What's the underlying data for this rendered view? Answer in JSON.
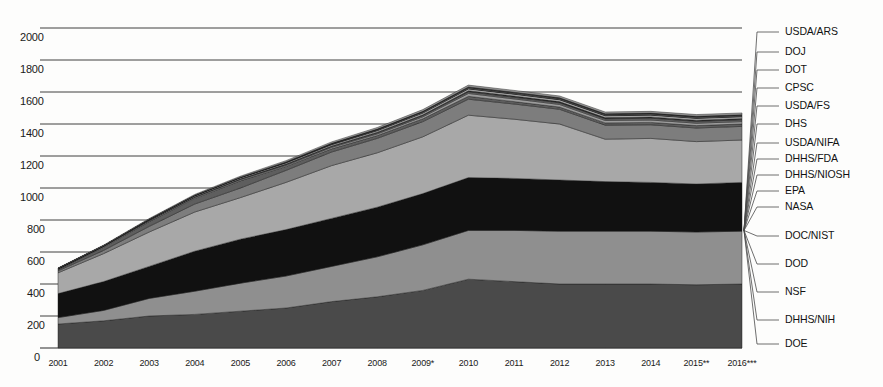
{
  "chart_data": {
    "type": "area",
    "title": "",
    "xlabel": "",
    "ylabel": "",
    "stacked": true,
    "grid": true,
    "legend_position": "right-leader-lines",
    "ylim": [
      0,
      2000
    ],
    "yticks": [
      0,
      200,
      400,
      600,
      800,
      1000,
      1200,
      1400,
      1600,
      1800,
      2000
    ],
    "ytick_labels": [
      "0",
      "200",
      "400",
      "600",
      "800",
      "1000",
      "1200",
      "1400",
      "1600",
      "1800",
      "2000"
    ],
    "categories": [
      "2001",
      "2002",
      "2003",
      "2004",
      "2005",
      "2006",
      "2007",
      "2008",
      "2009*",
      "2010",
      "2011",
      "2012",
      "2013",
      "2014",
      "2015**",
      "2016***"
    ],
    "x_values": [
      2001,
      2002,
      2003,
      2004,
      2005,
      2006,
      2007,
      2008,
      2009,
      2010,
      2011,
      2012,
      2013,
      2014,
      2015,
      2016
    ],
    "footnotes": [
      "* 2009 includes ARRA funds",
      "** 2015 estimate",
      "*** 2016 proposed"
    ],
    "series": [
      {
        "name": "DOE",
        "color": "#4a4a4a",
        "values": [
          150,
          170,
          200,
          210,
          230,
          250,
          290,
          320,
          360,
          430,
          415,
          400,
          400,
          400,
          395,
          400
        ]
      },
      {
        "name": "DHHS/NIH",
        "color": "#8f8f8f",
        "values": [
          40,
          65,
          110,
          145,
          175,
          200,
          220,
          250,
          285,
          305,
          320,
          330,
          330,
          330,
          330,
          330
        ]
      },
      {
        "name": "NSF",
        "color": "#111111",
        "values": [
          150,
          180,
          200,
          250,
          275,
          290,
          300,
          310,
          320,
          330,
          325,
          320,
          310,
          305,
          300,
          305
        ]
      },
      {
        "name": "DOD",
        "color": "#a8a8a8",
        "values": [
          130,
          175,
          215,
          245,
          260,
          295,
          330,
          340,
          355,
          390,
          370,
          350,
          265,
          275,
          265,
          265
        ]
      },
      {
        "name": "DOC/NIST",
        "color": "#7d7d7d",
        "values": [
          12,
          20,
          35,
          50,
          60,
          75,
          85,
          90,
          95,
          100,
          95,
          92,
          88,
          85,
          85,
          85
        ]
      },
      {
        "name": "NASA",
        "color": "#5e5e5e",
        "values": [
          8,
          20,
          30,
          35,
          45,
          25,
          20,
          18,
          18,
          18,
          15,
          14,
          14,
          15,
          15,
          15
        ]
      },
      {
        "name": "EPA",
        "color": "#9c9c9c",
        "values": [
          5,
          6,
          6,
          6,
          7,
          7,
          9,
          10,
          12,
          18,
          17,
          16,
          15,
          15,
          15,
          15
        ]
      },
      {
        "name": "DHHS/NIOSH",
        "color": "#6a6a6a",
        "values": [
          0,
          0,
          2,
          3,
          4,
          5,
          6,
          7,
          8,
          10,
          10,
          10,
          10,
          11,
          11,
          11
        ]
      },
      {
        "name": "DHHS/FDA",
        "color": "#303030",
        "values": [
          0,
          0,
          0,
          2,
          2,
          3,
          3,
          4,
          5,
          7,
          8,
          8,
          8,
          8,
          8,
          8
        ]
      },
      {
        "name": "USDA/NIFA",
        "color": "#b5b5b5",
        "values": [
          2,
          3,
          4,
          5,
          6,
          7,
          8,
          9,
          10,
          11,
          11,
          11,
          11,
          11,
          11,
          11
        ]
      },
      {
        "name": "DHS",
        "color": "#3d3d3d",
        "values": [
          0,
          0,
          1,
          2,
          2,
          2,
          2,
          3,
          3,
          3,
          3,
          3,
          3,
          3,
          3,
          3
        ]
      },
      {
        "name": "USDA/FS",
        "color": "#8a8a8a",
        "values": [
          0,
          0,
          1,
          1,
          1,
          2,
          3,
          4,
          5,
          5,
          5,
          5,
          5,
          5,
          5,
          5
        ]
      },
      {
        "name": "CPSC",
        "color": "#505050",
        "values": [
          0,
          0,
          0,
          0,
          0,
          1,
          1,
          1,
          1,
          2,
          2,
          2,
          2,
          2,
          2,
          2
        ]
      },
      {
        "name": "DOT",
        "color": "#c0c0c0",
        "values": [
          0,
          0,
          0,
          0,
          0,
          1,
          1,
          1,
          1,
          2,
          2,
          2,
          2,
          2,
          2,
          2
        ]
      },
      {
        "name": "DOJ",
        "color": "#262626",
        "values": [
          0,
          0,
          0,
          0,
          0,
          0,
          1,
          1,
          1,
          1,
          1,
          1,
          1,
          1,
          1,
          1
        ]
      },
      {
        "name": "USDA/ARS",
        "color": "#9a9a9a",
        "values": [
          3,
          4,
          5,
          6,
          7,
          8,
          9,
          10,
          11,
          11,
          11,
          11,
          11,
          11,
          11,
          11
        ]
      }
    ],
    "legend_entries": [
      "USDA/ARS",
      "DOJ",
      "DOT",
      "CPSC",
      "USDA/FS",
      "DHS",
      "USDA/NIFA",
      "DHHS/FDA",
      "DHHS/NIOSH",
      "EPA",
      "NASA",
      "DOC/NIST",
      "DOD",
      "NSF",
      "DHHS/NIH",
      "DOE"
    ]
  },
  "colors": {
    "axis": "#1a1a1a",
    "grid": "#2b2b2b",
    "leader": "#4a4a4a",
    "background": "#fdfdfc"
  }
}
